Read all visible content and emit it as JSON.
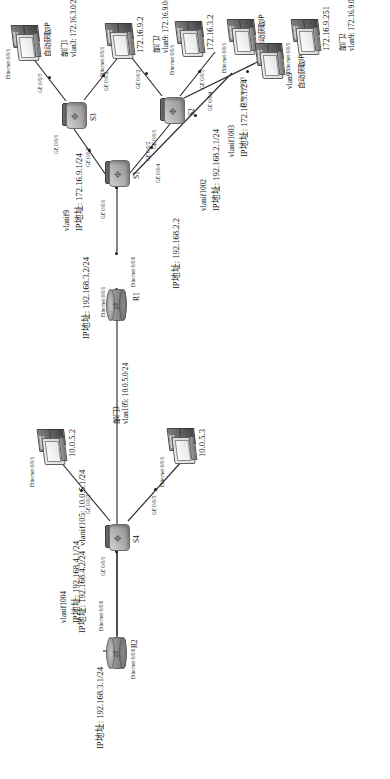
{
  "diagram": {
    "orientation": "rotated-90ccw"
  },
  "devices": {
    "r2": {
      "name": "R2",
      "type": "router",
      "interfaces": [
        {
          "port": "Ethernet 0/0/0",
          "ip_label": "IP地址: 192.168.3.1/24"
        },
        {
          "port": "Ethernet 0/0/0",
          "ip_label": "IP地址: 192.168.4.2/24"
        }
      ]
    },
    "r1": {
      "name": "R1",
      "type": "router",
      "interfaces": [
        {
          "port": "Ethernet 0/0/1",
          "ip_label": "IP地址: 192.168.3.2/24"
        },
        {
          "port": "Ethernet 0/0/0",
          "ip_label": "IP地址: 192.168.2.2"
        }
      ]
    },
    "s4": {
      "name": "S4",
      "type": "switch",
      "vlanif_a": "vlanif1004",
      "vlanif_a_ip": "IP地址: 192.168.4.1/24",
      "vlanif_b": "vlanif105: 10.0.5.1/24",
      "ports": [
        "GE 0/0/1",
        "GE 0/0/2",
        "GE 0/0/3"
      ]
    },
    "s1": {
      "name": "S1",
      "type": "switch",
      "vlanif9": "vlanif9",
      "vlanif9_ip": "IP地址: 172.16.9.1/24",
      "vlanif1002": "vlanif1002",
      "vlanif1002_ip": "IP地址: 192.168.2.1/24",
      "vlanif1003": "vlanif1003",
      "vlanif1003_ip": "IP地址: 172.16.3.1/24",
      "ports": [
        "GE 0/0/1",
        "GE 0/0/2",
        "GE 0/0/3",
        "GE 0/0/4"
      ]
    },
    "s3": {
      "name": "S3",
      "type": "switch",
      "ports": [
        "GE 0/0/1",
        "GE 0/0/2",
        "GE 0/0/3"
      ]
    },
    "s2": {
      "name": "S2",
      "type": "switch",
      "ports": [
        "GE 0/0/1",
        "GE 0/0/2",
        "GE 0/0/3",
        "GE 0/0/4"
      ]
    }
  },
  "hosts": {
    "pc_10_0_5_2": {
      "port": "Ethernet 0/0/1",
      "ip": "10.0.5.2"
    },
    "pc_10_0_5_3": {
      "port": "Ethernet 0/0/1",
      "ip": "10.0.5.3"
    },
    "pc_auto_s3": {
      "port": "Ethernet 0/0/1",
      "ip": "自动获取IP"
    },
    "pc_172_16_9_2": {
      "port": "Ethernet 0/0/1",
      "ip": "172.16.9.2"
    },
    "pc_172_16_3_2": {
      "port": "Ethernet 0/0/1",
      "ip": "172.16.3.2"
    },
    "pc_auto_s2": {
      "port": "Ethernet 0/0/1",
      "ip": "自动获取IP"
    },
    "pc_vlan9_auto": {
      "port": "Ethernet 0/0/1",
      "tag": "vlan9",
      "ip": "自动获取IP"
    },
    "pc_172_16_9_251": {
      "port": "Ethernet 0/0/1",
      "ip": "172.16.9.251"
    }
  },
  "departments": {
    "dept3": {
      "name": "部门3",
      "subnet": "vlan105: 10.0.5.0/24"
    },
    "dept1": {
      "name": "部门1",
      "subnet": "vlan3: 172.16.3.0/24"
    },
    "dept2_a": {
      "name": "部门2",
      "subnet": "vlan9: 172.16.9.0/24"
    },
    "dept2_b": {
      "name": "部门2",
      "subnet": "vlan9: 172.16.9.0/24"
    }
  },
  "links": [
    {
      "from": "R2",
      "to": "S4",
      "from_port": "Ethernet 0/0/0",
      "to_port": "GE 0/0/1"
    },
    {
      "from": "R2",
      "to": "R1",
      "from_port": "Ethernet 0/0/0",
      "to_port": "Ethernet 0/0/1"
    },
    {
      "from": "R1",
      "to": "S1",
      "from_port": "Ethernet 0/0/0",
      "to_port": "GE 0/0/1"
    },
    {
      "from": "S4",
      "to": "pc_10_0_5_2",
      "from_port": "GE 0/0/2"
    },
    {
      "from": "S4",
      "to": "pc_10_0_5_3",
      "from_port": "GE 0/0/3"
    },
    {
      "from": "S1",
      "to": "S3",
      "from_port": "GE 0/0/3",
      "to_port": "GE 0/0/1"
    },
    {
      "from": "S1",
      "to": "S2",
      "from_port": "GE 0/0/2",
      "to_port": "GE 0/0/1"
    },
    {
      "from": "S1",
      "to": "pc_vlan9_auto",
      "from_port": "GE 0/0/4"
    },
    {
      "from": "S3",
      "to": "pc_auto_s3",
      "from_port": "GE 0/0/3"
    },
    {
      "from": "S3",
      "to": "pc_172_16_9_2",
      "from_port": "GE 0/0/2"
    },
    {
      "from": "S2",
      "to": "pc_172_16_3_2",
      "from_port": "GE 0/0/2"
    },
    {
      "from": "S2",
      "to": "pc_auto_s2",
      "from_port": "GE 0/0/3"
    },
    {
      "from": "S2",
      "to": "pc_172_16_9_251",
      "from_port": "GE 0/0/4"
    }
  ],
  "colors": {
    "line": "#2b2b2b",
    "text": "#111111",
    "background": "#ffffff"
  }
}
